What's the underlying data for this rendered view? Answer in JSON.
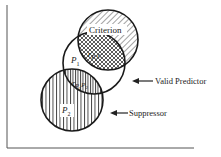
{
  "diagram": {
    "type": "venn",
    "circles": [
      {
        "id": "criterion",
        "label": "Criterion",
        "cx": 108,
        "cy": 40,
        "r": 30,
        "hatch": "diagonal"
      },
      {
        "id": "p1",
        "label": "P",
        "subscript": "1",
        "cx": 94,
        "cy": 63,
        "r": 31,
        "hatch": "none"
      },
      {
        "id": "p2",
        "label": "P",
        "subscript": "2",
        "cx": 72,
        "cy": 100,
        "r": 31,
        "hatch": "vertical"
      }
    ],
    "overlaps": [
      {
        "id": "r_p1c",
        "label": "r",
        "subscript": "P1C",
        "hatch": "crosshatch"
      },
      {
        "id": "r_p1p2",
        "label": "r",
        "subscript": "P1P2",
        "hatch": "dense-vertical"
      }
    ],
    "annotations": [
      {
        "id": "valid-predictor",
        "text": "Valid Predictor",
        "arrow": "left"
      },
      {
        "id": "suppressor",
        "text": "Suppressor",
        "arrow": "left"
      }
    ],
    "colors": {
      "ink": "#222222",
      "background": "#ffffff"
    }
  },
  "labels": {
    "criterion": "Criterion",
    "p1_main": "P",
    "p1_sub": "1",
    "p2_main": "P",
    "p2_sub": "2",
    "rp1c_main": "r",
    "rp1c_sub1": "P",
    "rp1c_sub2": "1",
    "rp1c_sub3": "C",
    "rp1p2_main": "r",
    "rp1p2_sub1": "P",
    "rp1p2_sub2": "1",
    "rp1p2_sub3": "P",
    "rp1p2_sub4": "2",
    "valid_predictor": "Valid Predictor",
    "suppressor": "Suppressor"
  }
}
